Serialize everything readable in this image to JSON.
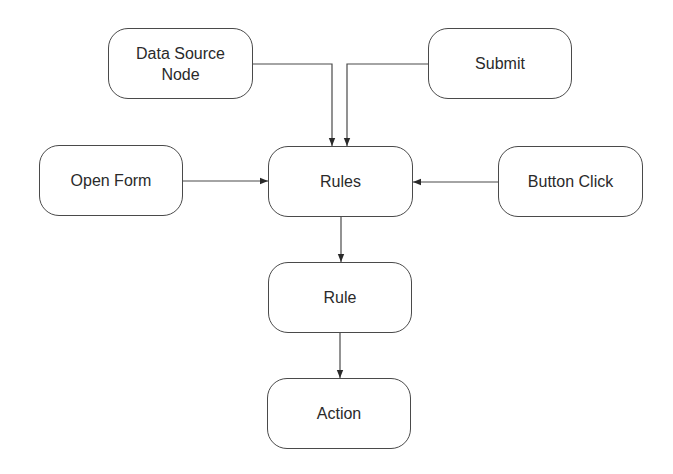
{
  "diagram": {
    "type": "flowchart",
    "nodes": [
      {
        "id": "data_source_node",
        "label": "Data Source Node",
        "line1": "Data Source",
        "line2": "Node"
      },
      {
        "id": "submit",
        "label": "Submit"
      },
      {
        "id": "open_form",
        "label": "Open Form"
      },
      {
        "id": "rules",
        "label": "Rules"
      },
      {
        "id": "button_click",
        "label": "Button Click"
      },
      {
        "id": "rule",
        "label": "Rule"
      },
      {
        "id": "action",
        "label": "Action"
      }
    ],
    "edges": [
      {
        "from": "data_source_node",
        "to": "rules"
      },
      {
        "from": "submit",
        "to": "rules"
      },
      {
        "from": "open_form",
        "to": "rules"
      },
      {
        "from": "button_click",
        "to": "rules"
      },
      {
        "from": "rules",
        "to": "rule"
      },
      {
        "from": "rule",
        "to": "action"
      }
    ],
    "colors": {
      "stroke": "#4a4a4a",
      "text": "#2a2a2a",
      "background": "#ffffff"
    }
  }
}
